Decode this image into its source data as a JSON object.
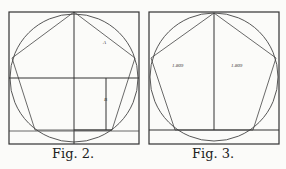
{
  "figures": [
    {
      "caption": "Fig. 2.",
      "labels": {
        "a": "A",
        "b": "B"
      },
      "description": "Regular pentagon inscribed in circle within a square frame, with horizontal diameter, vertical center line and an inner rectangle"
    },
    {
      "caption": "Fig. 3.",
      "labels": {
        "left": "1.809",
        "right": "1.809"
      },
      "description": "Regular pentagon inscribed in circle within a square frame, vertical center line dividing two golden rectangles"
    }
  ],
  "colors": {
    "line": "#333333",
    "background": "#fbfbf9"
  }
}
